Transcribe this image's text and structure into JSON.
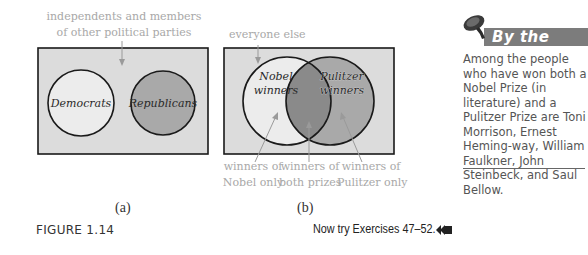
{
  "figure": {
    "label": "FIGURE 1.14",
    "exercise_prompt": "Now try Exercises 47–52.",
    "exercise_icon": "double-left-arrow-icon"
  },
  "diagram_a": {
    "caption": "(a)",
    "universe_note_line1": "independents and members",
    "universe_note_line2": "of other political parties",
    "set_left": "Democrats",
    "set_right": "Republicans",
    "colors": {
      "universe": "#dcdcdc",
      "set_left": "#ececec",
      "set_right": "#a9a9a9",
      "outline": "#1a1a1a",
      "note": "#a8a8a8"
    }
  },
  "diagram_b": {
    "caption": "(b)",
    "universe_note": "everyone else",
    "set_left_line1": "Nobel",
    "set_left_line2": "winners",
    "set_right_line1": "Pulitzer",
    "set_right_line2": "winners",
    "bottom_labels": [
      {
        "line1": "winners of",
        "line2": "Nobel only"
      },
      {
        "line1": "winners of",
        "line2": "both prizes"
      },
      {
        "line1": "winners of",
        "line2": "Pulitzer only"
      }
    ],
    "colors": {
      "universe": "#dcdcdc",
      "set_left": "#ececec",
      "set_right": "#a9a9a9",
      "intersection": "#8a8a8a",
      "outline": "#1a1a1a"
    }
  },
  "sidebar": {
    "icon": "pushpin-icon",
    "title": "By the Way",
    "body": "Among the people who have won both a Nobel Prize (in literature) and a Pulitzer Prize are Toni Morrison, Ernest Heming-way, William Faulkner, John Steinbeck, and Saul Bellow."
  }
}
